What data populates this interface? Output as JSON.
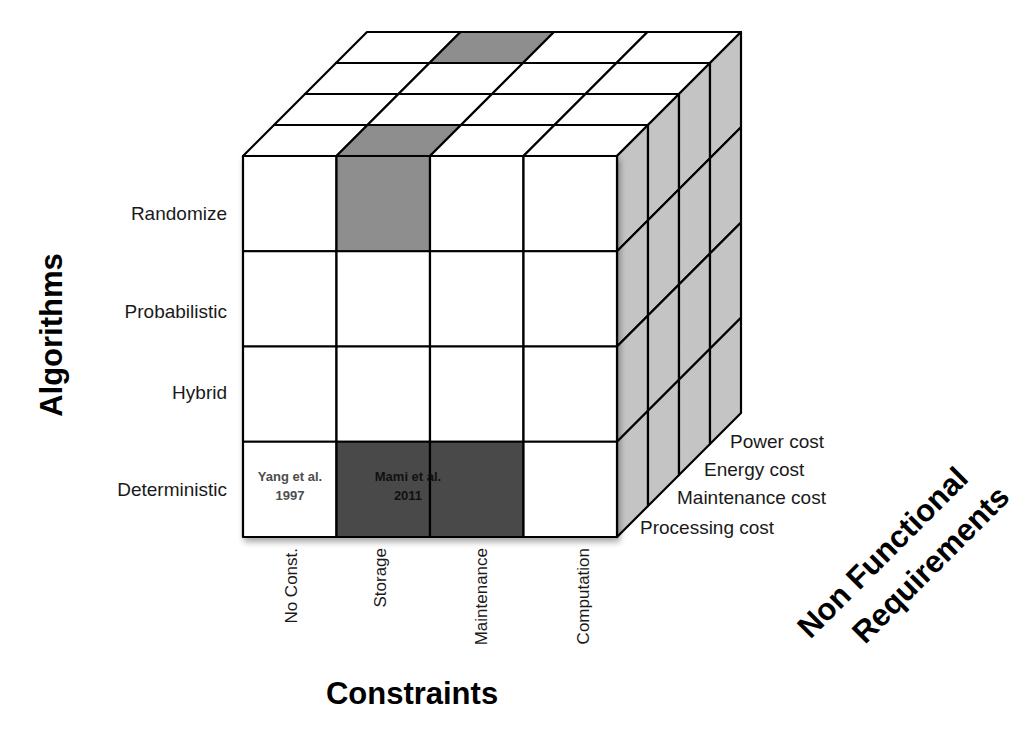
{
  "diagram": {
    "type": "3d-taxonomy-cube",
    "axes": {
      "vertical": {
        "title": "Algorithms",
        "levels": [
          "Randomize",
          "Probabilistic",
          "Hybrid",
          "Deterministic"
        ]
      },
      "horizontal": {
        "title": "Constraints",
        "levels": [
          "No Const.",
          "Storage",
          "Maintenance",
          "Computation"
        ]
      },
      "depth": {
        "title_line1": "Non Functional",
        "title_line2": "Requirements",
        "levels": [
          "Processing cost",
          "Maintenance cost",
          "Energy cost",
          "Power cost"
        ]
      }
    },
    "colors": {
      "white_cell": "#ffffff",
      "side_face": "#c4c4c4",
      "highlight_medium": "#8e8e8e",
      "highlight_dark": "#4a4a4a",
      "stroke": "#000000"
    },
    "highlighted_cells": [
      {
        "algorithm": "Randomize",
        "constraint": "Storage",
        "shade": "medium",
        "label": ""
      },
      {
        "algorithm": "Deterministic",
        "constraint": "Storage",
        "shade": "dark",
        "label": ""
      },
      {
        "algorithm": "Deterministic",
        "constraint": "Maintenance",
        "shade": "dark",
        "label": ""
      }
    ],
    "highlighted_top_cells": [
      {
        "constraint": "Storage",
        "depth_index": 0,
        "shade": "medium"
      },
      {
        "constraint": "Storage",
        "depth_index": 3,
        "shade": "medium"
      }
    ],
    "annotations": [
      {
        "id": "yang",
        "line1": "Yang et al.",
        "line2": "1997",
        "algorithm": "Deterministic",
        "constraint": "No Const.",
        "color": "#4d4d4d"
      },
      {
        "id": "mami",
        "line1": "Mami et al.",
        "line2": "2011",
        "algorithm": "Deterministic",
        "constraint": "Storage-Maintenance",
        "color": "#111111"
      }
    ]
  }
}
